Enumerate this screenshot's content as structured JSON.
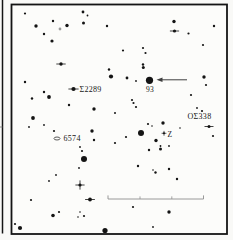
{
  "page_background": "#f9f9f7",
  "chart_data": {
    "type": "scatter",
    "subtype": "astronomical-finder-chart",
    "ink_color": "#141414",
    "paper_color": "#fcfcfa",
    "frame": {
      "x": 11.5,
      "y": 4.5,
      "width": 215.5,
      "height": 229.5,
      "stroke_width": 1.8
    },
    "neighbor_chart_edge": {
      "x": 2.5,
      "y_top": 0,
      "y_bottom": 233.5,
      "stroke_width": 1.5,
      "tick_y": 127
    },
    "labels": [
      {
        "id": "sigma2289",
        "text": "Σ2289",
        "x": 79.5,
        "y": 92,
        "anchor": "start",
        "size": 8
      },
      {
        "id": "star93",
        "text": "93",
        "x": 150,
        "y": 91.5,
        "anchor": "middle",
        "size": 7.5
      },
      {
        "id": "os338",
        "text": "ΟΣ338",
        "x": 187.5,
        "y": 119,
        "anchor": "start",
        "size": 8
      },
      {
        "id": "n6574",
        "text": "6574",
        "x": 63.5,
        "y": 141,
        "anchor": "start",
        "size": 8
      },
      {
        "id": "varZ",
        "text": "Z",
        "x": 167.5,
        "y": 136.5,
        "anchor": "start",
        "size": 7.5
      }
    ],
    "symbols": {
      "nebula_oval": {
        "cx": 57,
        "cy": 138.5,
        "rx": 3.0,
        "ry": 1.5
      },
      "variable_star": {
        "cx": 164,
        "cy": 133.3,
        "r": 1.0,
        "spike": 2.4
      }
    },
    "arrow": {
      "x_tail": 187,
      "x_tip": 156.5,
      "y": 79.8,
      "head_w": 6,
      "head_h": 4.6,
      "color": "#3f3f3f"
    },
    "scale_bar": {
      "y": 199,
      "x_start": 108,
      "x_end": 203.5,
      "mid_ticks": [
        140,
        171.8
      ],
      "end_tick_h": 3.6,
      "mid_tick_h": 2.6,
      "color": "#8f8f8f"
    },
    "stars": [
      [
        25,
        13.5,
        1.1
      ],
      [
        83,
        12,
        1.4
      ],
      [
        87.5,
        15.5,
        0.9
      ],
      [
        53,
        21,
        1.2
      ],
      [
        60,
        29,
        1.4,
        "g"
      ],
      [
        67,
        25.5,
        1.7
      ],
      [
        83.5,
        23,
        1.5
      ],
      [
        107,
        26,
        1.2
      ],
      [
        36,
        26,
        1.7
      ],
      [
        44,
        34,
        1.2
      ],
      [
        52,
        41,
        1.6
      ],
      [
        61,
        64,
        1.7,
        "h"
      ],
      [
        109,
        69.5,
        1.2
      ],
      [
        111,
        76.5,
        2.1
      ],
      [
        25,
        82,
        1.2
      ],
      [
        73.5,
        89,
        2.1,
        "h"
      ],
      [
        44,
        92,
        1.2
      ],
      [
        49,
        97,
        1.9
      ],
      [
        32,
        98.5,
        1.2
      ],
      [
        69,
        105,
        1.2
      ],
      [
        94,
        109,
        1.7
      ],
      [
        115,
        113,
        1.0
      ],
      [
        33,
        118,
        1.9
      ],
      [
        29,
        127,
        0.9
      ],
      [
        44,
        125,
        0.9
      ],
      [
        54,
        131,
        1.1
      ],
      [
        92,
        131,
        1.7
      ],
      [
        94,
        140,
        1.2
      ],
      [
        115,
        143,
        1.1
      ],
      [
        80,
        147,
        0.9
      ],
      [
        82,
        151,
        1.1
      ],
      [
        84,
        159,
        3.0
      ],
      [
        79,
        168,
        0.9
      ],
      [
        56,
        175,
        0.9
      ],
      [
        49,
        181,
        0.9
      ],
      [
        80,
        185,
        1.6,
        "+"
      ],
      [
        31,
        200,
        1.1
      ],
      [
        90,
        199.5,
        1.9,
        "h"
      ],
      [
        15,
        224,
        1.1
      ],
      [
        20,
        228,
        2.1
      ],
      [
        53,
        215.5,
        1.8
      ],
      [
        59,
        212,
        1.1
      ],
      [
        80,
        212,
        0.8
      ],
      [
        78,
        217,
        0.8
      ],
      [
        84,
        216,
        1.1
      ],
      [
        105,
        230.5,
        2.6
      ],
      [
        133,
        207,
        1.1
      ],
      [
        169,
        212,
        1.7
      ],
      [
        153,
        227,
        0.9
      ],
      [
        123,
        50.5,
        1.1
      ],
      [
        143,
        48,
        1.1
      ],
      [
        145.5,
        53,
        1.1
      ],
      [
        143,
        64.5,
        1.2
      ],
      [
        143.3,
        67.5,
        1.5
      ],
      [
        149.5,
        80.3,
        3.6
      ],
      [
        127,
        78,
        1.4
      ],
      [
        136,
        81,
        0.9
      ],
      [
        132,
        100,
        1.1
      ],
      [
        133.5,
        103,
        1.1
      ],
      [
        136,
        107,
        1.1
      ],
      [
        174,
        21.5,
        1.7
      ],
      [
        174.5,
        31,
        1.6,
        "h"
      ],
      [
        188.5,
        33.5,
        1.1
      ],
      [
        214,
        26,
        1.2
      ],
      [
        203,
        45,
        1.1
      ],
      [
        204,
        77,
        1.7
      ],
      [
        206,
        85,
        1.1
      ],
      [
        191,
        95,
        1.1
      ],
      [
        197,
        108,
        0.9
      ],
      [
        202,
        111,
        1.1
      ],
      [
        209,
        126.5,
        1.5,
        "h"
      ],
      [
        213,
        136,
        1.1
      ],
      [
        148,
        124,
        1.1
      ],
      [
        163,
        123,
        1.7
      ],
      [
        141,
        133,
        3.0
      ],
      [
        126,
        137,
        1.1
      ],
      [
        156,
        140.5,
        1.7
      ],
      [
        149,
        150,
        1.2
      ],
      [
        160.5,
        146,
        0.9
      ],
      [
        160.5,
        149,
        1.5
      ],
      [
        169,
        146,
        0.9
      ],
      [
        138,
        166,
        1.2
      ],
      [
        153,
        170,
        0.8
      ],
      [
        155.5,
        172.5,
        1.2
      ],
      [
        169,
        169,
        1.2
      ],
      [
        177,
        179,
        1.2
      ],
      [
        152,
        126,
        0.8
      ],
      [
        180,
        128,
        0.8
      ]
    ],
    "star_flags_legend": {
      "h": "horizontal-diffraction-spikes",
      "+": "cross-spikes",
      "g": "gray-faint-star"
    },
    "gray_star_color": "#9a9a9a"
  }
}
